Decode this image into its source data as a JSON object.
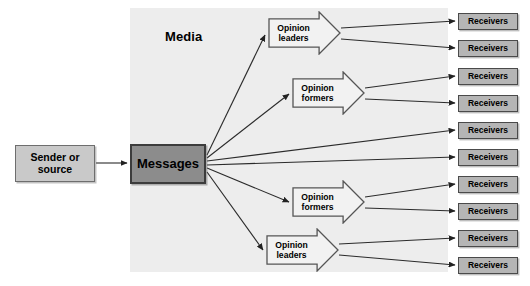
{
  "diagram": {
    "media_label": "Media",
    "colors": {
      "panel": "#ededed",
      "sender_fill": "#c9c9c9",
      "messages_fill": "#8c8c8c",
      "receiver_fill": "#b5b5b5",
      "opinion_fill": "#f2f2f2",
      "stroke": "#333333",
      "text": "#000000"
    },
    "panel": {
      "x": 130,
      "y": 8,
      "width": 318,
      "height": 264
    },
    "media_label_pos": {
      "x": 165,
      "y": 29
    },
    "sender": {
      "label_line1": "Sender or",
      "label_line2": "source",
      "x": 15,
      "y": 145,
      "width": 80,
      "height": 37
    },
    "messages": {
      "label": "Messages",
      "x": 130,
      "y": 144,
      "width": 76,
      "height": 40
    },
    "opinion_nodes": [
      {
        "id": "opinion-leaders-top",
        "line1": "Opinion",
        "line2": "leaders",
        "x": 268,
        "y": 11,
        "width": 73,
        "height": 44
      },
      {
        "id": "opinion-formers-upper",
        "line1": "Opinion",
        "line2": "formers",
        "x": 292,
        "y": 71,
        "width": 73,
        "height": 44
      },
      {
        "id": "opinion-formers-lower",
        "line1": "Opinion",
        "line2": "formers",
        "x": 292,
        "y": 180,
        "width": 73,
        "height": 44
      },
      {
        "id": "opinion-leaders-bottom",
        "line1": "Opinion",
        "line2": "leaders",
        "x": 266,
        "y": 228,
        "width": 73,
        "height": 44
      }
    ],
    "receiver_label": "Receivers",
    "receivers": [
      {
        "index": 1,
        "x": 458,
        "y": 13,
        "width": 60,
        "height": 17
      },
      {
        "index": 2,
        "x": 458,
        "y": 40,
        "width": 60,
        "height": 17
      },
      {
        "index": 3,
        "x": 458,
        "y": 68,
        "width": 60,
        "height": 17
      },
      {
        "index": 4,
        "x": 458,
        "y": 95,
        "width": 60,
        "height": 17
      },
      {
        "index": 5,
        "x": 458,
        "y": 122,
        "width": 60,
        "height": 17
      },
      {
        "index": 6,
        "x": 458,
        "y": 149,
        "width": 60,
        "height": 17
      },
      {
        "index": 7,
        "x": 458,
        "y": 176,
        "width": 60,
        "height": 17
      },
      {
        "index": 8,
        "x": 458,
        "y": 203,
        "width": 60,
        "height": 17
      },
      {
        "index": 9,
        "x": 458,
        "y": 230,
        "width": 60,
        "height": 17
      },
      {
        "index": 10,
        "x": 458,
        "y": 257,
        "width": 60,
        "height": 17
      }
    ],
    "connections": [
      {
        "from": "sender",
        "to": "messages",
        "x1": 96,
        "y1": 163,
        "x2": 127,
        "y2": 163
      },
      {
        "from": "messages",
        "to": "opinion-leaders-top",
        "x1": 207,
        "y1": 155,
        "x2": 265,
        "y2": 35
      },
      {
        "from": "messages",
        "to": "opinion-formers-upper",
        "x1": 207,
        "y1": 158,
        "x2": 289,
        "y2": 94
      },
      {
        "from": "messages",
        "to": "receiver-5",
        "x1": 207,
        "y1": 161,
        "x2": 455,
        "y2": 130
      },
      {
        "from": "messages",
        "to": "receiver-6",
        "x1": 207,
        "y1": 165,
        "x2": 455,
        "y2": 157
      },
      {
        "from": "messages",
        "to": "opinion-formers-lower",
        "x1": 207,
        "y1": 168,
        "x2": 289,
        "y2": 202
      },
      {
        "from": "messages",
        "to": "opinion-leaders-bottom",
        "x1": 207,
        "y1": 172,
        "x2": 263,
        "y2": 250
      },
      {
        "from": "opinion-leaders-top",
        "to": "receiver-1",
        "x1": 341,
        "y1": 28,
        "x2": 455,
        "y2": 21
      },
      {
        "from": "opinion-leaders-top",
        "to": "receiver-2",
        "x1": 341,
        "y1": 39,
        "x2": 455,
        "y2": 48
      },
      {
        "from": "opinion-formers-upper",
        "to": "receiver-3",
        "x1": 365,
        "y1": 88,
        "x2": 455,
        "y2": 76
      },
      {
        "from": "opinion-formers-upper",
        "to": "receiver-4",
        "x1": 365,
        "y1": 99,
        "x2": 455,
        "y2": 103
      },
      {
        "from": "opinion-formers-lower",
        "to": "receiver-7",
        "x1": 365,
        "y1": 197,
        "x2": 455,
        "y2": 184
      },
      {
        "from": "opinion-formers-lower",
        "to": "receiver-8",
        "x1": 365,
        "y1": 208,
        "x2": 455,
        "y2": 211
      },
      {
        "from": "opinion-leaders-bottom",
        "to": "receiver-9",
        "x1": 339,
        "y1": 244,
        "x2": 455,
        "y2": 238
      },
      {
        "from": "opinion-leaders-bottom",
        "to": "receiver-10",
        "x1": 339,
        "y1": 255,
        "x2": 455,
        "y2": 265
      }
    ]
  }
}
